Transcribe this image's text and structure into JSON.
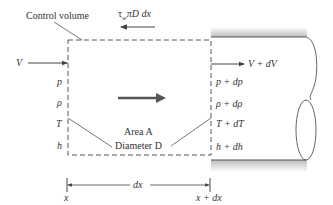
{
  "labels": {
    "control_volume": "Control volume",
    "shear_force": "τ",
    "shear_sub": "w",
    "shear_rest": "πD dx",
    "inlet_velocity": "V",
    "outlet_velocity": "V + dV",
    "inlet_props": [
      "p",
      "ρ",
      "T",
      "h"
    ],
    "outlet_props": [
      "p + dp",
      "ρ + dρ",
      "T + dT",
      "h + dh"
    ],
    "area": "Area A",
    "diameter": "Diameter D",
    "dx": "dx",
    "x_start": "x",
    "x_end": "x + dx"
  },
  "colors": {
    "line": "#444444",
    "wall_shade": "#bbbbbb",
    "arrow": "#555555"
  }
}
